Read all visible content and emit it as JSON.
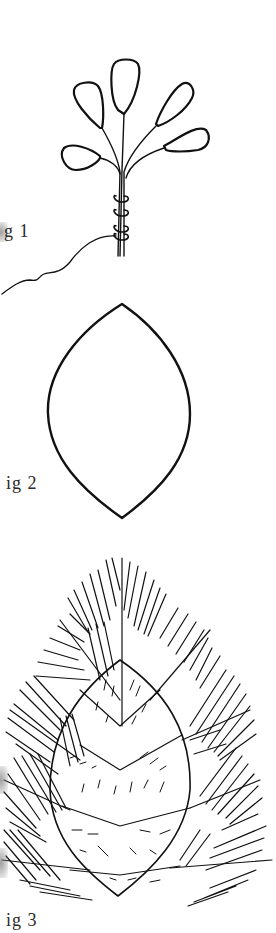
{
  "figures": [
    {
      "id": "fig1",
      "label": "g 1",
      "description": "Five rounded petal loops on wire stems bound together with a spiral wrap, with a trailing wire"
    },
    {
      "id": "fig2",
      "label": "ig 2",
      "description": "Pointed oval (vesica / leaf-shaped) outline"
    },
    {
      "id": "fig3",
      "label": "ig 3",
      "description": "Pine-branch sprays radiating around a pointed oval, filled with chevron bands and short hatch strokes"
    }
  ],
  "colors": {
    "ink": "#111111",
    "paper": "#ffffff",
    "label": "#2a2a2a"
  }
}
